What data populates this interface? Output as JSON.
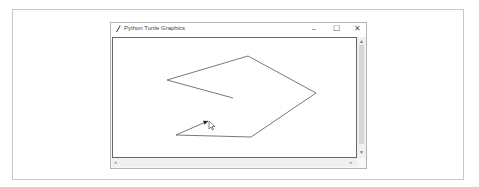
{
  "window": {
    "title": "Python Turtle Graphics",
    "icon": "feather-icon",
    "controls": {
      "minimize": "–",
      "maximize": "☐",
      "close": "✕"
    }
  },
  "scrollbars": {
    "up": "▲",
    "down": "▼",
    "left": "◂",
    "right": "▸"
  },
  "canvas": {
    "line_color": "#555555",
    "path": [
      [
        233,
        98
      ],
      [
        167,
        80
      ],
      [
        248,
        56
      ],
      [
        316,
        93
      ],
      [
        251,
        137
      ],
      [
        176,
        135
      ],
      [
        208,
        121
      ]
    ],
    "turtle_position": [
      208,
      121
    ],
    "cursor_position": [
      209,
      121
    ]
  }
}
